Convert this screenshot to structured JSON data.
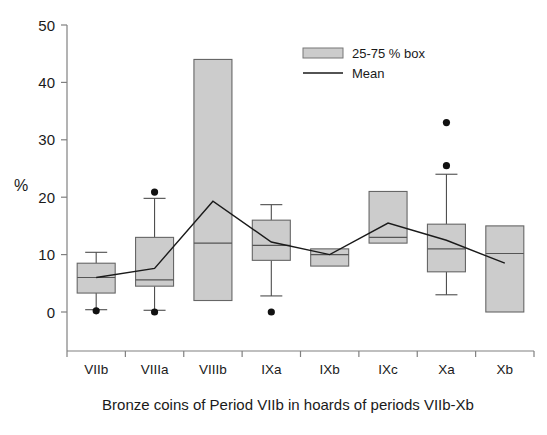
{
  "chart_data": {
    "type": "box",
    "title": "",
    "caption": "Bronze coins of Period VIIb in hoards of periods VIIb-Xb",
    "xlabel": "",
    "ylabel": "%",
    "ylim": [
      0,
      50
    ],
    "yticks": [
      0,
      10,
      20,
      30,
      40,
      50
    ],
    "ytick_labels": [
      "0",
      "10",
      "20",
      "30",
      "40",
      "50"
    ],
    "grid": false,
    "legend_position": "top-right",
    "legend": [
      {
        "label": "25-75 % box",
        "marker": "box",
        "color": "#cccccc"
      },
      {
        "label": "Mean",
        "marker": "line",
        "color": "#1a1a1a"
      }
    ],
    "categories": [
      "VIIb",
      "VIIIa",
      "VIIIb",
      "IXa",
      "IXb",
      "IXc",
      "Xa",
      "Xb"
    ],
    "boxes": [
      {
        "category": "VIIb",
        "q1": 3.3,
        "median": 6.0,
        "q3": 8.5,
        "whisker_low": 0.4,
        "whisker_high": 10.4,
        "outliers": [
          0.2
        ]
      },
      {
        "category": "VIIIa",
        "q1": 4.5,
        "median": 5.6,
        "q3": 13.0,
        "whisker_low": 0.3,
        "whisker_high": 19.8,
        "outliers": [
          20.9,
          0.0
        ]
      },
      {
        "category": "VIIIb",
        "q1": 2.0,
        "median": 12.0,
        "q3": 44.0,
        "whisker_low": null,
        "whisker_high": null,
        "outliers": []
      },
      {
        "category": "IXa",
        "q1": 9.0,
        "median": 11.6,
        "q3": 16.0,
        "whisker_low": 2.8,
        "whisker_high": 18.7,
        "outliers": [
          0.0
        ]
      },
      {
        "category": "IXb",
        "q1": 8.0,
        "median": 10.0,
        "q3": 11.0,
        "whisker_low": null,
        "whisker_high": null,
        "outliers": []
      },
      {
        "category": "IXc",
        "q1": 12.0,
        "median": 13.0,
        "q3": 21.0,
        "whisker_low": null,
        "whisker_high": null,
        "outliers": []
      },
      {
        "category": "Xa",
        "q1": 7.0,
        "median": 11.0,
        "q3": 15.3,
        "whisker_low": 3.0,
        "whisker_high": 24.0,
        "outliers": [
          33.0,
          25.5
        ]
      },
      {
        "category": "Xb",
        "q1": 0.0,
        "median": 10.2,
        "q3": 15.0,
        "whisker_low": null,
        "whisker_high": null,
        "outliers": []
      }
    ],
    "series": [
      {
        "name": "Mean",
        "type": "line",
        "x": [
          "VIIb",
          "VIIIa",
          "VIIIb",
          "IXa",
          "IXb",
          "IXc",
          "Xa",
          "Xb"
        ],
        "values": [
          6.0,
          7.6,
          19.3,
          12.2,
          10.0,
          15.5,
          12.5,
          8.5
        ]
      }
    ]
  },
  "colors": {
    "box_fill": "#cccccc",
    "box_stroke": "#666666",
    "axis": "#808080",
    "mean": "#1a1a1a",
    "outlier": "#111111",
    "background": "#ffffff"
  }
}
